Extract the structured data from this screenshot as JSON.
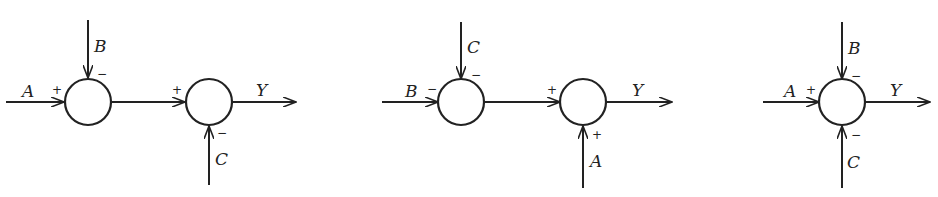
{
  "diagrams": [
    {
      "id": "a",
      "inputs": {
        "left": "A",
        "top": "B",
        "bottom": "C"
      },
      "junction1": {
        "left_sign": "+",
        "top_sign": "−"
      },
      "junction2": {
        "left_sign": "+",
        "bottom_sign": "−"
      },
      "output": "Y"
    },
    {
      "id": "b",
      "inputs": {
        "left": "B",
        "top": "C",
        "bottom": "A"
      },
      "junction1": {
        "left_sign": "−",
        "top_sign": "−"
      },
      "junction2": {
        "left_sign": "+",
        "bottom_sign": "+"
      },
      "output": "Y"
    },
    {
      "id": "c",
      "inputs": {
        "left": "A",
        "top": "B",
        "bottom": "C"
      },
      "junction1": {
        "left_sign": "+",
        "top_sign": "−",
        "bottom_sign": "−"
      },
      "output": "Y"
    }
  ],
  "colors": {
    "stroke": "#222222",
    "background": "#ffffff"
  }
}
